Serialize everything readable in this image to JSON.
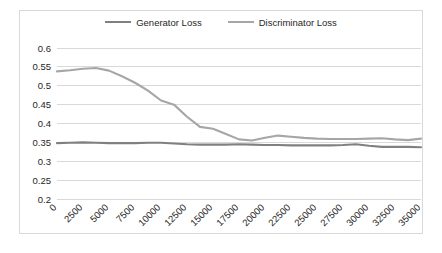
{
  "chart_data": {
    "type": "line",
    "title": "",
    "xlabel": "",
    "ylabel": "",
    "xlim": [
      0,
      35000
    ],
    "ylim": [
      0.2,
      0.6
    ],
    "grid": true,
    "legend_position": "top-center",
    "x_tick_labels": [
      "0",
      "2500",
      "5000",
      "7500",
      "10000",
      "12500",
      "15000",
      "17500",
      "20000",
      "22500",
      "25000",
      "27500",
      "30000",
      "32500",
      "35000"
    ],
    "y_tick_labels": [
      "0.2",
      "0.25",
      "0.3",
      "0.35",
      "0.4",
      "0.45",
      "0.5",
      "0.55",
      "0.6"
    ],
    "y_ticks": [
      0.2,
      0.25,
      0.3,
      0.35,
      0.4,
      0.45,
      0.5,
      0.55,
      0.6
    ],
    "x": [
      0,
      1250,
      2500,
      3750,
      5000,
      6250,
      7500,
      8750,
      10000,
      11250,
      12500,
      13750,
      15000,
      16250,
      17500,
      18750,
      20000,
      21250,
      22500,
      23750,
      25000,
      26250,
      27500,
      28750,
      30000,
      31250,
      32500,
      33750,
      35000
    ],
    "series": [
      {
        "name": "Generator Loss",
        "color": "#808080",
        "values": [
          0.348,
          0.349,
          0.35,
          0.349,
          0.348,
          0.348,
          0.348,
          0.349,
          0.349,
          0.347,
          0.345,
          0.344,
          0.344,
          0.344,
          0.345,
          0.344,
          0.343,
          0.343,
          0.342,
          0.342,
          0.342,
          0.342,
          0.343,
          0.345,
          0.341,
          0.338,
          0.338,
          0.338,
          0.337
        ]
      },
      {
        "name": "Discriminator Loss",
        "color": "#A6A6A6",
        "values": [
          0.538,
          0.541,
          0.545,
          0.547,
          0.54,
          0.525,
          0.508,
          0.487,
          0.461,
          0.45,
          0.418,
          0.391,
          0.386,
          0.372,
          0.358,
          0.355,
          0.362,
          0.368,
          0.365,
          0.362,
          0.36,
          0.359,
          0.359,
          0.359,
          0.36,
          0.361,
          0.358,
          0.356,
          0.36
        ]
      }
    ]
  },
  "legend": {
    "entries": [
      {
        "label": "Generator Loss",
        "color": "#808080"
      },
      {
        "label": "Discriminator Loss",
        "color": "#A6A6A6"
      }
    ]
  }
}
